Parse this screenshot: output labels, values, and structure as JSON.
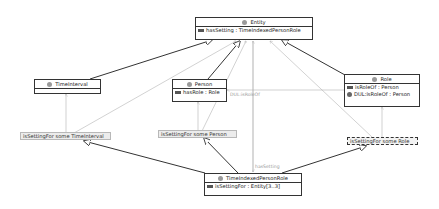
{
  "classes": {
    "entity": {
      "name": "Entity",
      "attrs": [
        {
          "icon": "object-property-icon",
          "text": "hasSetting : TimeIndexedPersonRole"
        }
      ]
    },
    "time_interval": {
      "name": "TimeInterval",
      "attrs": []
    },
    "person": {
      "name": "Person",
      "attrs": [
        {
          "icon": "object-property-icon",
          "text": "hasRole : Role"
        }
      ]
    },
    "role": {
      "name": "Role",
      "attrs": [
        {
          "icon": "object-property-icon",
          "text": "isRoleOf : Person"
        },
        {
          "icon": "imported-property-icon",
          "text": "DUL:isRoleOf : Person"
        }
      ]
    },
    "tipr": {
      "name": "TimeIndexedPersonRole",
      "attrs": [
        {
          "icon": "object-property-icon",
          "text": "isSettingFor : Entity[3..3]"
        }
      ]
    }
  },
  "restrictions": {
    "time_interval": "isSettingFor some TimeInterval",
    "person": "isSettingFor some Person",
    "role": "isSettingFor some Role"
  },
  "edge_labels": {
    "dul_is_role_of": "DUL:isRoleOf",
    "has_setting": "hasSetting"
  },
  "colors": {
    "subclass_edge": "#333333",
    "property_edge": "#b0b0b0",
    "class_border": "#333333",
    "restriction_fill": "#ececec"
  }
}
